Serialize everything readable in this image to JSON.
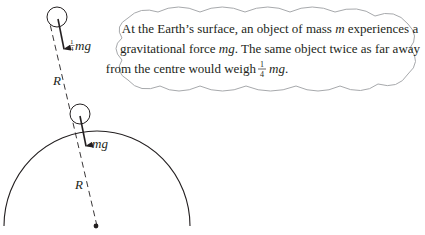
{
  "diagram": {
    "colors": {
      "ink": "#231f20",
      "cloud_stroke": "#a7a9ac",
      "dash": "#231f20"
    },
    "upper_object": {
      "force_label_coeff_num": "1",
      "force_label_coeff_den": "4",
      "force_label": "mg"
    },
    "lower_object": {
      "force_label": "mg"
    },
    "distance_labels": {
      "upper_R": "R",
      "lower_R": "R"
    },
    "callout": {
      "line1_a": "At the Earth’s surface, an object of mass ",
      "line1_m": "m",
      "line1_b": " experiences a",
      "line2_a": "gravitational force ",
      "line2_mg": "mg",
      "line2_b": ". The same object twice as far away",
      "line3_a": "from the centre would weigh ",
      "line3_num": "1",
      "line3_den": "4",
      "line3_mg": "mg",
      "line3_end": "."
    }
  }
}
